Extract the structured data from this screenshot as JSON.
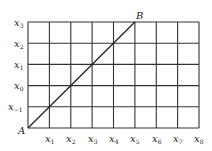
{
  "diagram": {
    "type": "grid-line-graph",
    "grid": {
      "columns": 8,
      "rows": 5
    },
    "x_labels": [
      {
        "base": "x",
        "sub": "1"
      },
      {
        "base": "x",
        "sub": "2"
      },
      {
        "base": "x",
        "sub": "3"
      },
      {
        "base": "x",
        "sub": "4"
      },
      {
        "base": "x",
        "sub": "5"
      },
      {
        "base": "x",
        "sub": "6"
      },
      {
        "base": "x",
        "sub": "7"
      },
      {
        "base": "x",
        "sub": "8"
      }
    ],
    "y_labels": [
      {
        "base": "x",
        "sub": "−1"
      },
      {
        "base": "x",
        "sub": "0"
      },
      {
        "base": "x",
        "sub": "1"
      },
      {
        "base": "x",
        "sub": "2"
      },
      {
        "base": "x",
        "sub": "3"
      }
    ],
    "points": {
      "start": {
        "label": "A",
        "col": 0,
        "row": 0
      },
      "end": {
        "label": "B",
        "col": 5,
        "row": 5
      }
    },
    "colors": {
      "grid": "#333333",
      "line": "#222222",
      "text": "#222222"
    }
  }
}
